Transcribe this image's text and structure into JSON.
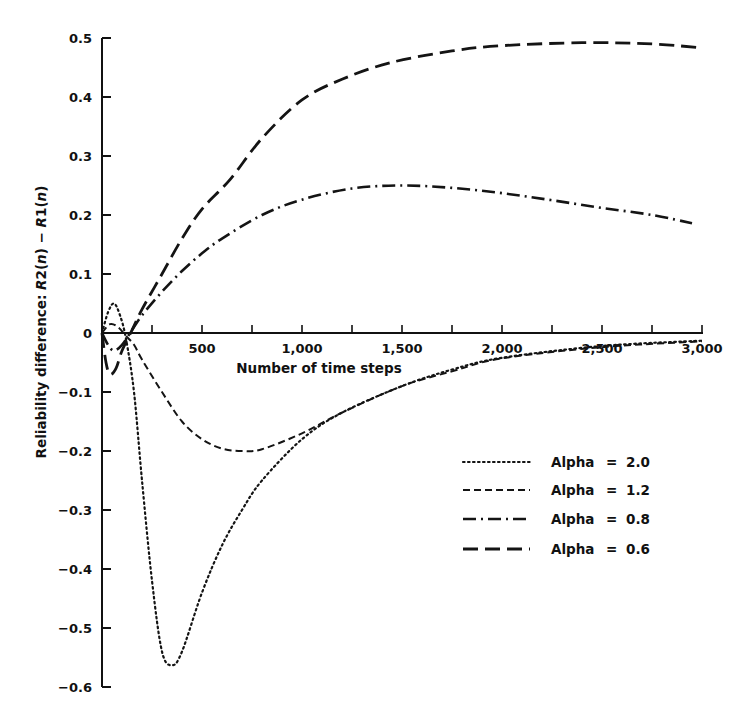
{
  "chart_data": {
    "type": "line",
    "title": "",
    "xlabel": "Number of time steps",
    "ylabel": "Reliability difference: R2(n) − R1(n)",
    "ylabel_parts": [
      "Reliability difference: ",
      "R",
      "2(",
      "n",
      ") − ",
      "R",
      "1(",
      "n",
      ")"
    ],
    "xlim": [
      0,
      3000
    ],
    "ylim": [
      -0.6,
      0.5
    ],
    "grid": false,
    "legend_position": "lower right",
    "x_ticks": [
      0,
      250,
      500,
      750,
      1000,
      1250,
      1500,
      1750,
      2000,
      2250,
      2500,
      2750,
      3000
    ],
    "x_tick_labels": [
      {
        "value": 500,
        "label": "500"
      },
      {
        "value": 1000,
        "label": "1,000"
      },
      {
        "value": 1500,
        "label": "1,500"
      },
      {
        "value": 2000,
        "label": "2,000"
      },
      {
        "value": 2500,
        "label": "2,500"
      },
      {
        "value": 3000,
        "label": "3,000"
      }
    ],
    "y_ticks": [
      {
        "value": 0.5,
        "label": "0.5"
      },
      {
        "value": 0.4,
        "label": "0.4"
      },
      {
        "value": 0.3,
        "label": "0.3"
      },
      {
        "value": 0.2,
        "label": "0.2"
      },
      {
        "value": 0.1,
        "label": "0.1"
      },
      {
        "value": 0,
        "label": "0"
      },
      {
        "value": -0.1,
        "label": "−0.1"
      },
      {
        "value": -0.2,
        "label": "−0.2"
      },
      {
        "value": -0.3,
        "label": "−0.3"
      },
      {
        "value": -0.4,
        "label": "−0.4"
      },
      {
        "value": -0.5,
        "label": "−0.5"
      },
      {
        "value": -0.6,
        "label": "−0.6"
      }
    ],
    "series": [
      {
        "name": "Alpha = 2.0",
        "style": "dotted",
        "x": [
          0,
          30,
          60,
          90,
          120,
          160,
          200,
          250,
          300,
          350,
          400,
          500,
          600,
          700,
          800,
          1000,
          1200,
          1500,
          1750,
          2000,
          2500,
          3000
        ],
        "y": [
          0.0,
          0.035,
          0.05,
          0.03,
          -0.01,
          -0.1,
          -0.25,
          -0.42,
          -0.54,
          -0.563,
          -0.54,
          -0.44,
          -0.36,
          -0.3,
          -0.25,
          -0.18,
          -0.135,
          -0.09,
          -0.062,
          -0.042,
          -0.022,
          -0.013
        ]
      },
      {
        "name": "Alpha = 1.2",
        "style": "dashed",
        "x": [
          0,
          40,
          80,
          120,
          160,
          200,
          300,
          400,
          500,
          600,
          700,
          800,
          1000,
          1200,
          1500,
          1750,
          2000,
          2500,
          3000
        ],
        "y": [
          0.0,
          0.015,
          0.01,
          -0.005,
          -0.02,
          -0.045,
          -0.1,
          -0.15,
          -0.18,
          -0.196,
          -0.2,
          -0.197,
          -0.17,
          -0.135,
          -0.09,
          -0.065,
          -0.043,
          -0.024,
          -0.014
        ]
      },
      {
        "name": "Alpha = 0.8",
        "style": "dash-dot",
        "x": [
          0,
          30,
          60,
          100,
          150,
          200,
          300,
          400,
          500,
          600,
          800,
          1000,
          1250,
          1500,
          1750,
          2000,
          2250,
          2500,
          2750,
          2950
        ],
        "y": [
          0.0,
          -0.02,
          -0.03,
          -0.02,
          0.005,
          0.03,
          0.07,
          0.105,
          0.135,
          0.16,
          0.2,
          0.226,
          0.245,
          0.25,
          0.246,
          0.237,
          0.225,
          0.212,
          0.2,
          0.186
        ]
      },
      {
        "name": "Alpha = 0.6",
        "style": "long-dashed",
        "x": [
          0,
          20,
          40,
          70,
          100,
          150,
          200,
          300,
          400,
          500,
          640,
          800,
          1000,
          1200,
          1440,
          1750,
          2000,
          2400,
          2750,
          3000
        ],
        "y": [
          0.0,
          -0.05,
          -0.07,
          -0.06,
          -0.03,
          0.005,
          0.04,
          0.1,
          0.16,
          0.21,
          0.26,
          0.33,
          0.395,
          0.43,
          0.458,
          0.478,
          0.487,
          0.492,
          0.49,
          0.483
        ]
      }
    ]
  },
  "legend": {
    "items": [
      {
        "label": "Alpha",
        "eq": "=",
        "value": "2.0"
      },
      {
        "label": "Alpha",
        "eq": "=",
        "value": "1.2"
      },
      {
        "label": "Alpha",
        "eq": "=",
        "value": "0.8"
      },
      {
        "label": "Alpha",
        "eq": "=",
        "value": "0.6"
      }
    ]
  }
}
